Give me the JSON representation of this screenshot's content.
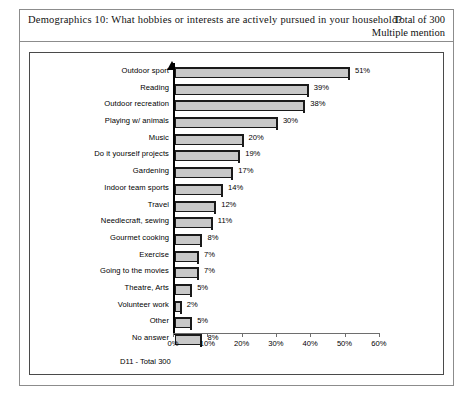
{
  "header": {
    "question": "Demographics 10: What hobbies or interests are actively pursued in your household?",
    "total": "Total of 300",
    "mention": "Multiple mention"
  },
  "chart_note": "D11 -  Total 300",
  "footer_note": "",
  "colors": {
    "bar_fill": "#c8c8c8",
    "bar_outline": "#1a1a1a",
    "frame": "#4a4a4a",
    "border": "#8c8c8c",
    "text": "#000000"
  },
  "chart_data": {
    "type": "bar",
    "orientation": "horizontal",
    "title": "Demographics 10: What hobbies or interests are actively pursued in your household?",
    "xlabel": "",
    "ylabel": "",
    "xlim": [
      0,
      65
    ],
    "xticks": [
      0,
      10,
      20,
      30,
      40,
      50,
      60
    ],
    "xtick_labels": [
      "0%",
      "10%",
      "20%",
      "30%",
      "40%",
      "50%",
      "60%"
    ],
    "grid": false,
    "legend": false,
    "value_suffix": "%",
    "categories": [
      "Outdoor sport",
      "Reading",
      "Outdoor recreation",
      "Playing w/ animals",
      "Music",
      "Do it yourself projects",
      "Gardening",
      "Indoor team sports",
      "Travel",
      "Needlecraft, sewing",
      "Gourmet cooking",
      "Exercise",
      "Going to the movies",
      "Theatre, Arts",
      "Volunteer work",
      "Other",
      "No answer"
    ],
    "values": [
      51,
      39,
      38,
      30,
      20,
      19,
      17,
      14,
      12,
      11,
      8,
      7,
      7,
      5,
      2,
      5,
      8
    ],
    "data_labels": [
      "51%",
      "39%",
      "38%",
      "30%",
      "20%",
      "19%",
      "17%",
      "14%",
      "12%",
      "11%",
      "8%",
      "7%",
      "7%",
      "5%",
      "2%",
      "5%",
      "8%"
    ]
  }
}
